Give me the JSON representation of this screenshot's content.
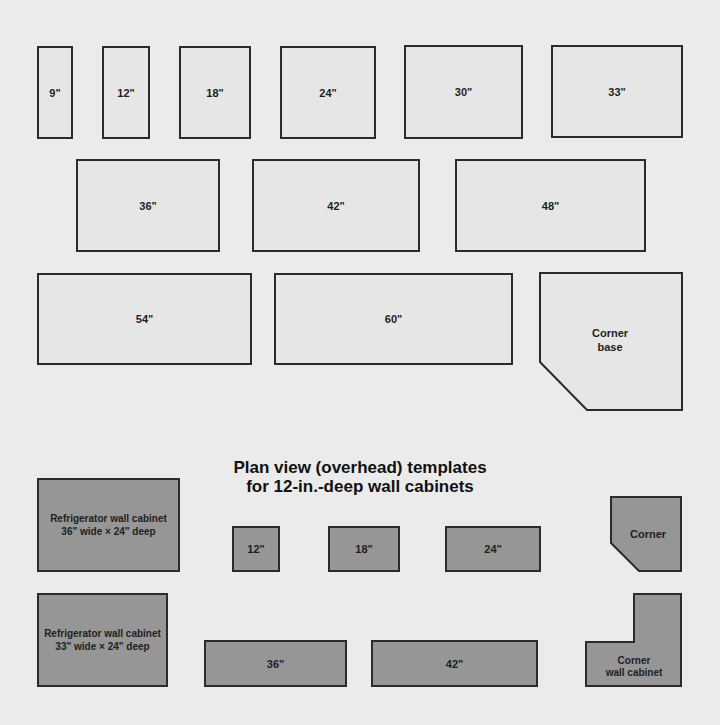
{
  "base_section": {
    "title_cut_off": true,
    "row1": [
      {
        "label": "9\"",
        "x": 37,
        "y": 46,
        "w": 36,
        "h": 93
      },
      {
        "label": "12\"",
        "x": 102,
        "y": 46,
        "w": 48,
        "h": 93
      },
      {
        "label": "18\"",
        "x": 179,
        "y": 46,
        "w": 72,
        "h": 93
      },
      {
        "label": "24\"",
        "x": 280,
        "y": 46,
        "w": 96,
        "h": 93
      },
      {
        "label": "30\"",
        "x": 404,
        "y": 45,
        "w": 119,
        "h": 94
      },
      {
        "label": "33\"",
        "x": 551,
        "y": 45,
        "w": 132,
        "h": 93
      }
    ],
    "row2": [
      {
        "label": "36\"",
        "x": 76,
        "y": 159,
        "w": 144,
        "h": 93
      },
      {
        "label": "42\"",
        "x": 252,
        "y": 159,
        "w": 168,
        "h": 93
      },
      {
        "label": "48\"",
        "x": 455,
        "y": 159,
        "w": 191,
        "h": 93
      }
    ],
    "row3": [
      {
        "label": "54\"",
        "x": 37,
        "y": 273,
        "w": 215,
        "h": 92
      },
      {
        "label": "60\"",
        "x": 274,
        "y": 273,
        "w": 239,
        "h": 92
      }
    ],
    "corner_base": {
      "line1": "Corner",
      "line2": "base"
    }
  },
  "wall_section": {
    "heading_line1": "Plan view (overhead) templates",
    "heading_line2": "for 12-in.-deep wall cabinets",
    "refrigerator_36": {
      "line1": "Refrigerator wall cabinet",
      "line2": "36\" wide × 24\" deep"
    },
    "refrigerator_33": {
      "line1": "Refrigerator wall cabinet",
      "line2": "33\" wide × 24\" deep"
    },
    "row1": [
      {
        "label": "12\"",
        "x": 232,
        "y": 526,
        "w": 48,
        "h": 46
      },
      {
        "label": "18\"",
        "x": 328,
        "y": 526,
        "w": 72,
        "h": 46
      },
      {
        "label": "24\"",
        "x": 445,
        "y": 526,
        "w": 96,
        "h": 46
      }
    ],
    "row2": [
      {
        "label": "36\"",
        "x": 204,
        "y": 640,
        "w": 143,
        "h": 47
      },
      {
        "label": "42\"",
        "x": 371,
        "y": 640,
        "w": 167,
        "h": 47
      }
    ],
    "corner": {
      "label": "Corner"
    },
    "corner_wall_cabinet": {
      "line1": "Corner",
      "line2": "wall cabinet"
    }
  },
  "colors": {
    "background": "#ebebeb",
    "base_fill": "#e6e6e6",
    "wall_fill": "#969696",
    "outline": "#2b2b2b"
  }
}
